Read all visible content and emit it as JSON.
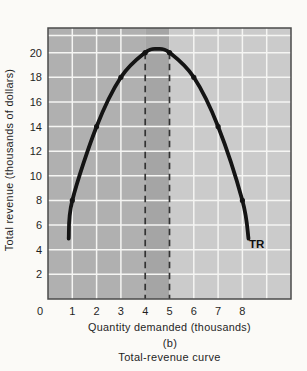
{
  "chart_data": {
    "type": "line",
    "title": "Total-revenue curve",
    "panel_label": "(b)",
    "xlabel": "Quantity demanded (thousands)",
    "ylabel": "Total revenue (thousands of dollars)",
    "curve_label": "TR",
    "x_ticks": [
      0,
      1,
      2,
      3,
      4,
      5,
      6,
      7,
      8
    ],
    "y_ticks": [
      2,
      4,
      6,
      8,
      10,
      12,
      14,
      16,
      18,
      20
    ],
    "xlim": [
      0,
      10
    ],
    "ylim": [
      0,
      22
    ],
    "x_gridlines": [
      1,
      2,
      3,
      6,
      7,
      8,
      9
    ],
    "y_gridlines": [
      2,
      4,
      6,
      8,
      10,
      12,
      14,
      16,
      18,
      20,
      21.4
    ],
    "dashed_guides_x": [
      4,
      5
    ],
    "dashed_guides_top_y": 20,
    "regions": [
      {
        "from": 0,
        "to": 4,
        "color": "#b0b0b0"
      },
      {
        "from": 4,
        "to": 5,
        "color": "#a5a5a5"
      },
      {
        "from": 5,
        "to": 10,
        "color": "#cbcbcb"
      }
    ],
    "series": [
      {
        "name": "TR",
        "points": [
          [
            1,
            8
          ],
          [
            2,
            14
          ],
          [
            3,
            18
          ],
          [
            4,
            20
          ],
          [
            5,
            20
          ],
          [
            6,
            18
          ],
          [
            7,
            14
          ],
          [
            8,
            8
          ]
        ],
        "curve_through": [
          [
            0.85,
            4.9
          ],
          [
            1,
            8
          ],
          [
            2,
            14
          ],
          [
            3,
            18
          ],
          [
            4,
            20
          ],
          [
            4.5,
            20.3
          ],
          [
            5,
            20
          ],
          [
            6,
            18
          ],
          [
            7,
            14
          ],
          [
            8,
            8
          ],
          [
            8.25,
            4.9
          ]
        ],
        "color": "#141414"
      }
    ],
    "colors": {
      "gridline": "#f5f5f3",
      "border": "#4b4b4b",
      "dashed": "#333333",
      "text": "#1f1f1f",
      "page_bg": "#fbfaf7"
    },
    "legend_position": "none",
    "grid": true
  }
}
